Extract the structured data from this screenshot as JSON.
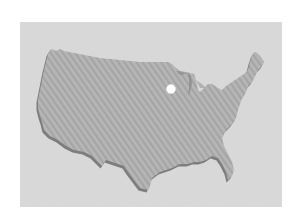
{
  "map": {
    "region": "United States (contiguous)",
    "style": "grayscale striped silhouette with drop shadow",
    "colors": {
      "page_background": "#ffffff",
      "panel_background": "#d9d9d9",
      "land_fill": "#b4b4b4",
      "land_stripe": "#a6a6a6",
      "shadow": "#7a7a7a",
      "marker": "#ffffff"
    },
    "marker": {
      "type": "location-dot",
      "x": 171,
      "y": 89,
      "radius": 4.5,
      "approx_location": "Upper Midwest (Minnesota / Wisconsin area)"
    }
  }
}
